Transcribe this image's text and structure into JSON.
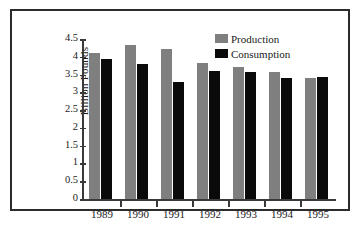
{
  "chart_data": {
    "type": "bar",
    "title": "",
    "xlabel": "",
    "ylabel": "Billion Pounds",
    "categories": [
      "1989",
      "1990",
      "1991",
      "1992",
      "1993",
      "1994",
      "1995"
    ],
    "series": [
      {
        "name": "Production",
        "color": "#7f7f7f",
        "values": [
          4.1,
          4.32,
          4.23,
          3.82,
          3.7,
          3.58,
          3.4
        ]
      },
      {
        "name": "Consumption",
        "color": "#0a0a0a",
        "values": [
          3.93,
          3.79,
          3.28,
          3.61,
          3.58,
          3.41,
          3.42
        ]
      }
    ],
    "ylim": [
      0,
      4.5
    ],
    "ytick_labels": [
      "0",
      "0.5",
      "1",
      "1.5",
      "2",
      "2.5",
      "3",
      "3.5",
      "4",
      "4.5"
    ],
    "ytick_values": [
      0,
      0.5,
      1,
      1.5,
      2,
      2.5,
      3,
      3.5,
      4,
      4.5
    ],
    "grid": false,
    "legend_position": "top-right"
  },
  "legend": {
    "items": [
      {
        "label": "Production"
      },
      {
        "label": "Consumption"
      }
    ]
  },
  "axes": {
    "y_title": "Billion Pounds"
  }
}
